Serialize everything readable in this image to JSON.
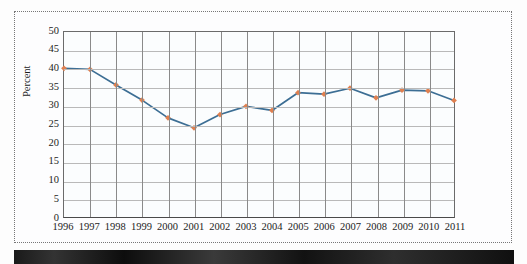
{
  "figure": {
    "name": "line-chart-percent-by-year",
    "background_color": "#fdfdfe",
    "frame_style": "dotted",
    "scan_band_color": "#1a1a1a"
  },
  "chart_data": {
    "type": "line",
    "title": "",
    "xlabel": "",
    "ylabel": "Percent",
    "x": [
      1996,
      1997,
      1998,
      1999,
      2000,
      2001,
      2002,
      2003,
      2004,
      2005,
      2006,
      2007,
      2008,
      2009,
      2010,
      2011
    ],
    "categories": [
      "1996",
      "1997",
      "1998",
      "1999",
      "2000",
      "2001",
      "2002",
      "2003",
      "2004",
      "2005",
      "2006",
      "2007",
      "2008",
      "2009",
      "2010",
      "2011"
    ],
    "values": [
      40.2,
      39.9,
      35.7,
      31.6,
      26.8,
      24.1,
      27.7,
      29.9,
      28.8,
      33.6,
      33.2,
      34.8,
      32.2,
      34.3,
      34.1,
      31.5
    ],
    "series": [
      {
        "name": "Percent",
        "values": [
          40.2,
          39.9,
          35.7,
          31.6,
          26.8,
          24.1,
          27.7,
          29.9,
          28.8,
          33.6,
          33.2,
          34.8,
          32.2,
          34.3,
          34.1,
          31.5
        ],
        "line_color": "#3c6e94",
        "marker_color": "#e08050",
        "marker_shape": "diamond"
      }
    ],
    "ylim": [
      0,
      50
    ],
    "yticks": [
      0,
      5,
      10,
      15,
      20,
      25,
      30,
      35,
      40,
      45,
      50
    ],
    "ytick_labels": [
      "0",
      "5",
      "10",
      "15",
      "20",
      "25",
      "30",
      "35",
      "40",
      "45",
      "50"
    ],
    "xlim": [
      1996,
      2011
    ],
    "grid": true,
    "grid_horizontal": true,
    "grid_vertical": true,
    "grid_color_horizontal": "#b9b9b9",
    "grid_color_vertical": "#8a8a8a",
    "legend": false,
    "legend_position": "none",
    "plot_background": "#fbfdfe",
    "annotations": []
  }
}
